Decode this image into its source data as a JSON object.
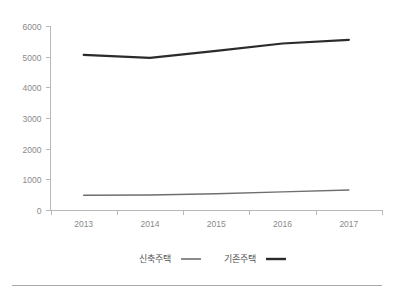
{
  "chart_data": {
    "type": "line",
    "title": "",
    "subtitle": "",
    "xlabel": "",
    "ylabel": "",
    "categories": [
      "2013",
      "2014",
      "2015",
      "2016",
      "2017"
    ],
    "series": [
      {
        "name": "신축주택",
        "values": [
          480,
          490,
          530,
          590,
          650
        ],
        "color": "#6e6e6e",
        "line_width": 1.4
      },
      {
        "name": "기존주택",
        "values": [
          5060,
          4960,
          5190,
          5430,
          5550
        ],
        "color": "#2b2b2b",
        "line_width": 2.2
      }
    ],
    "ylim": [
      0,
      6000
    ],
    "yticks": [
      "0",
      "1000",
      "2000",
      "3000",
      "4000",
      "5000",
      "6000"
    ],
    "ytick_values": [
      0,
      1000,
      2000,
      3000,
      4000,
      5000,
      6000
    ],
    "grid": false,
    "legend_position": "bottom",
    "axis_color": "#b8b8b8",
    "tick_label_color": "#8a8a8a",
    "legend_label_color": "#555555",
    "background_color": "#ffffff"
  },
  "legend": {
    "items": [
      {
        "label": "신축주택",
        "swatch_color": "#6e6e6e",
        "swatch_width": 1.6
      },
      {
        "label": "기존주택",
        "swatch_color": "#2b2b2b",
        "swatch_width": 2.4
      }
    ]
  },
  "footer": {
    "rule_color": "#a9a9a9"
  }
}
